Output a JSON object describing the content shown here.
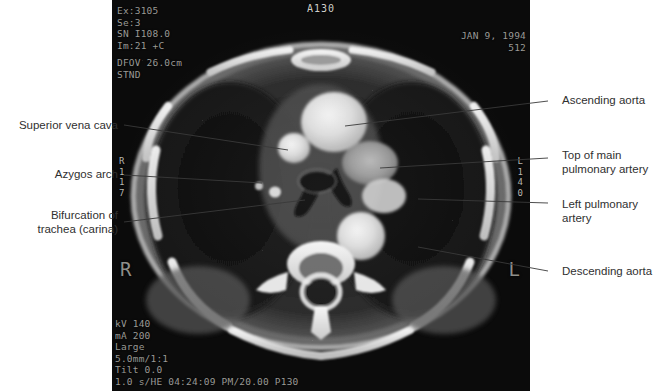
{
  "figure": {
    "kind": "ct-scan-annotated-figure",
    "background": "#ffffff"
  },
  "scan": {
    "modality_overlay": {
      "exam": "Ex:3105",
      "series": "Se:3",
      "slice_number": "SN I108.0",
      "image": "Im:21 +C",
      "dfov": "DFOV 26.0cm",
      "algorithm": "STND",
      "orientation_top": "A130",
      "date": "JAN 9, 1994",
      "matrix": "512",
      "kv": "kV 140",
      "ma": "mA 200",
      "focal_spot": "Large",
      "thickness": "5.0mm/1:1",
      "tilt": "Tilt 0.0",
      "footer": "1.0 s/HE 04:24:09 PM/20.00 P130"
    },
    "orientation_markers": {
      "left_stack": "R\n1\n1\n7",
      "right_stack": "L\n1\n4\n0",
      "big_right": "R",
      "big_left": "L"
    }
  },
  "annotations": {
    "left": [
      {
        "id": "superior-vena-cava",
        "text": "Superior vena cava"
      },
      {
        "id": "azygos-arch",
        "text": "Azygos arch"
      },
      {
        "id": "bifurcation-of-trachea",
        "text": "Bifurcation of\ntrachea (carina)"
      }
    ],
    "right": [
      {
        "id": "ascending-aorta",
        "text": "Ascending aorta"
      },
      {
        "id": "top-of-main-pulmonary-artery",
        "text": "Top of main\npulmonary artery"
      },
      {
        "id": "left-pulmonary-artery",
        "text": "Left pulmonary\nartery"
      },
      {
        "id": "descending-aorta",
        "text": "Descending aorta"
      }
    ]
  },
  "colors": {
    "label_text": "#303030",
    "leader_line": "#3a3a3a",
    "overlay_text": "#9a9a96",
    "panel_background": "#0a0a0a"
  }
}
